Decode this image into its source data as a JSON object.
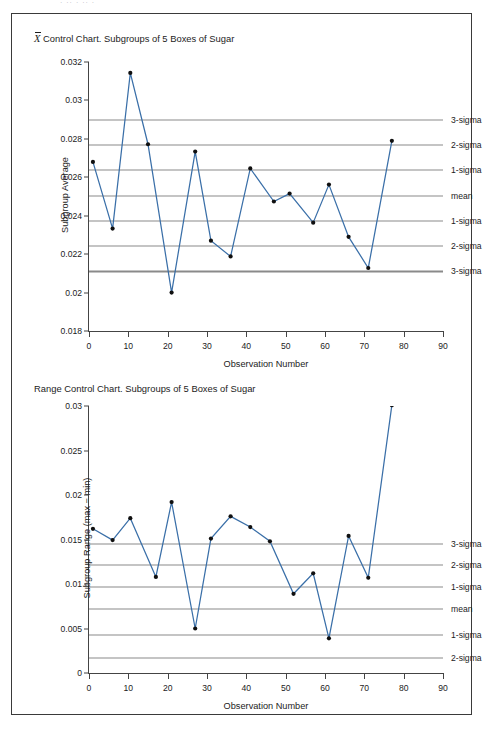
{
  "page": {
    "top_sliver_text": "·  ··            ·      ··   ·"
  },
  "charts": {
    "top": {
      "title_prefix": "X",
      "title": "Control Chart. Subgroups of 5 Boxes of Sugar",
      "ylabel": "Subgroup Average",
      "xlabel": "Observation Number",
      "yticks": [
        "0.018",
        "0.02",
        "0.022",
        "0.024",
        "0.026",
        "0.028",
        "0.03",
        "0.032"
      ],
      "xticks": [
        "0",
        "10",
        "20",
        "30",
        "40",
        "50",
        "60",
        "70",
        "80",
        "90"
      ],
      "sigma_labels": [
        "3-sigma",
        "2-sigma",
        "1-sigma",
        "mean",
        "1-sigma",
        "2-sigma",
        "3-sigma"
      ]
    },
    "bottom": {
      "title": "Range Control Chart. Subgroups of 5 Boxes of Sugar",
      "ylabel": "Subgroup Range (max − min)",
      "xlabel": "Observation Number",
      "yticks": [
        "0",
        "0.005",
        "0.01",
        "0.015",
        "0.02",
        "0.025",
        "0.03"
      ],
      "xticks": [
        "0",
        "10",
        "20",
        "30",
        "40",
        "50",
        "60",
        "70",
        "80",
        "90"
      ],
      "sigma_labels": [
        "3-sigma",
        "2-sigma",
        "1-sigma",
        "mean",
        "1-sigma",
        "2-sigma"
      ]
    }
  },
  "chart_data": [
    {
      "type": "line",
      "title": "X̄ Control Chart. Subgroups of 5 Boxes of Sugar",
      "xlabel": "Observation Number",
      "ylabel": "Subgroup Average",
      "xlim": [
        0,
        90
      ],
      "ylim": [
        0.018,
        0.032
      ],
      "xticks": [
        0,
        10,
        20,
        30,
        40,
        50,
        60,
        70,
        80,
        90
      ],
      "yticks": [
        0.018,
        0.02,
        0.022,
        0.024,
        0.026,
        0.028,
        0.03,
        0.032
      ],
      "grid": false,
      "legend": "none",
      "markers": true,
      "x": [
        1,
        6,
        10.5,
        15,
        21,
        27,
        31,
        36,
        41,
        47,
        51,
        57,
        61,
        66,
        71,
        77
      ],
      "y": [
        0.0268,
        0.02333,
        0.03143,
        0.02772,
        0.02,
        0.02734,
        0.0227,
        0.02188,
        0.02646,
        0.02474,
        0.02515,
        0.02364,
        0.02562,
        0.0229,
        0.02128,
        0.0279
      ],
      "annotation_lines": [
        {
          "label": "3-sigma",
          "value": 0.029
        },
        {
          "label": "2-sigma",
          "value": 0.02768
        },
        {
          "label": "1-sigma",
          "value": 0.02637
        },
        {
          "label": "mean",
          "value": 0.02505
        },
        {
          "label": "1-sigma",
          "value": 0.02373
        },
        {
          "label": "2-sigma",
          "value": 0.02242
        },
        {
          "label": "3-sigma",
          "value": 0.0211
        }
      ]
    },
    {
      "type": "line",
      "title": "Range Control Chart. Subgroups of 5 Boxes of Sugar",
      "xlabel": "Observation Number",
      "ylabel": "Subgroup Range (max − min)",
      "xlim": [
        0,
        90
      ],
      "ylim": [
        0,
        0.03
      ],
      "xticks": [
        0,
        10,
        20,
        30,
        40,
        50,
        60,
        70,
        80,
        90
      ],
      "yticks": [
        0,
        0.005,
        0.01,
        0.015,
        0.02,
        0.025,
        0.03
      ],
      "grid": false,
      "legend": "none",
      "markers": true,
      "x": [
        1,
        6,
        10.5,
        17,
        21,
        27,
        31,
        36,
        41,
        46,
        52,
        57,
        61,
        66,
        71,
        77
      ],
      "y": [
        0.0162,
        0.01493,
        0.0174,
        0.0108,
        0.0192,
        0.005,
        0.0151,
        0.0176,
        0.0164,
        0.0148,
        0.0089,
        0.0112,
        0.0039,
        0.0154,
        0.0107,
        0.0301
      ],
      "annotation_lines": [
        {
          "label": "3-sigma",
          "value": 0.0145
        },
        {
          "label": "2-sigma",
          "value": 0.0121
        },
        {
          "label": "1-sigma",
          "value": 0.00965
        },
        {
          "label": "mean",
          "value": 0.0072
        },
        {
          "label": "1-sigma",
          "value": 0.0043
        },
        {
          "label": "2-sigma",
          "value": 0.0017
        }
      ]
    }
  ]
}
